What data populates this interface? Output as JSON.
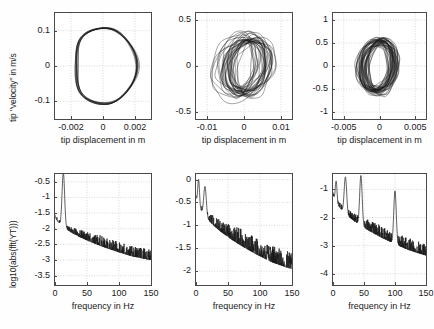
{
  "figure": {
    "background": "#fefefe",
    "axis_color": "#4a4a4a",
    "grid_color": "#c8c8c8",
    "curve_color": "#1a1a1a",
    "rows": 2,
    "cols": 3
  },
  "chart_data": [
    {
      "id": "phase-portrait-1",
      "type": "line",
      "title": "",
      "xlabel": "tip displacement in m",
      "ylabel": "tip \"velocity\" in m/s",
      "xlim": [
        -0.003,
        0.003
      ],
      "ylim": [
        -0.15,
        0.15
      ],
      "xticks": [
        -0.002,
        0,
        0.002
      ],
      "xticklabels": [
        "-0.002",
        "0",
        "0.002"
      ],
      "yticks": [
        -0.1,
        0,
        0.1
      ],
      "yticklabels": [
        "-0.1",
        "0",
        "0.1"
      ],
      "grid": true,
      "description": "Closed quasi-periodic limit cycle, single thick band orbit",
      "orbit": {
        "center_x": 0.0001,
        "center_y": 0.0,
        "radius_x": 0.0019,
        "radius_y": 0.112,
        "loops": 9,
        "jitter": 0.05,
        "shape": "rounded-hexagon"
      }
    },
    {
      "id": "phase-portrait-2",
      "type": "line",
      "title": "",
      "xlabel": "tip displacement in m",
      "ylabel": "",
      "xlim": [
        -0.013,
        0.013
      ],
      "ylim": [
        -0.58,
        0.58
      ],
      "xticks": [
        -0.01,
        0,
        0.01
      ],
      "xticklabels": [
        "-0.01",
        "0",
        "0.01"
      ],
      "yticks": [
        -0.5,
        0,
        0.5
      ],
      "yticklabels": [
        "-0.5",
        "0",
        "0.5"
      ],
      "grid": true,
      "description": "Chaotic attractor, many overlapping tilted loops skewed to the right",
      "orbit": {
        "center_x": 0.0,
        "center_y": 0.0,
        "radius_x": 0.0055,
        "radius_y": 0.3,
        "loops": 34,
        "jitter": 0.55,
        "shape": "chaotic-tilted"
      }
    },
    {
      "id": "phase-portrait-3",
      "type": "line",
      "title": "",
      "xlabel": "tip displacement in m",
      "ylabel": "",
      "xlim": [
        -0.0065,
        0.0065
      ],
      "ylim": [
        -1.15,
        1.15
      ],
      "xticks": [
        -0.005,
        0,
        0.005
      ],
      "xticklabels": [
        "-0.005",
        "0",
        "0.005"
      ],
      "yticks": [
        -1,
        -0.5,
        0,
        0.5,
        1
      ],
      "yticklabels": [
        "-1",
        "-0.5",
        "0",
        "0.5",
        "1"
      ],
      "grid": true,
      "description": "Dense chaotic attractor, tightly wound nested loops centered near origin",
      "orbit": {
        "center_x": -0.0002,
        "center_y": 0.0,
        "radius_x": 0.0022,
        "radius_y": 0.55,
        "loops": 40,
        "jitter": 0.4,
        "shape": "dense-oval"
      }
    },
    {
      "id": "spectrum-1",
      "type": "line",
      "title": "",
      "xlabel": "frequency in Hz",
      "ylabel": "log10(abs(fft(YT)))",
      "xlim": [
        0,
        150
      ],
      "ylim": [
        -3.8,
        -0.25
      ],
      "xticks": [
        0,
        50,
        100,
        150
      ],
      "xticklabels": [
        "0",
        "50",
        "100",
        "150"
      ],
      "yticks": [
        -3.5,
        -3,
        -2.5,
        -2,
        -1.5,
        -1,
        -0.5
      ],
      "yticklabels": [
        "-3.5",
        "-3",
        "-2.5",
        "-2",
        "-1.5",
        "-1",
        "-0.5"
      ],
      "grid": true,
      "description": "Single dominant narrow peak near 13 Hz clipping above axis top, then monotonic decay into noise floor near -3",
      "peaks": [
        {
          "freq": 13,
          "level": -0.2
        }
      ],
      "baseline_start": -1.55,
      "noise_floor": -3.05,
      "noise_amp": 0.28
    },
    {
      "id": "spectrum-2",
      "type": "line",
      "title": "",
      "xlabel": "frequency in Hz",
      "ylabel": "",
      "xlim": [
        0,
        150
      ],
      "ylim": [
        -2.3,
        0.12
      ],
      "xticks": [
        0,
        50,
        100,
        150
      ],
      "xticklabels": [
        "0",
        "50",
        "100",
        "150"
      ],
      "yticks": [
        -2,
        -1.5,
        -1,
        -0.5,
        0
      ],
      "yticklabels": [
        "-2",
        "-1.5",
        "-1",
        "-0.5",
        "0"
      ],
      "grid": true,
      "description": "Broadband chaotic spectrum, strongest below 25 Hz near 0, gradual roll-off to about -2.1 at 150 Hz",
      "peaks": [
        {
          "freq": 4,
          "level": 0.0
        },
        {
          "freq": 14,
          "level": -0.15
        }
      ],
      "baseline_start": -0.35,
      "noise_floor": -2.0,
      "noise_amp": 0.3
    },
    {
      "id": "spectrum-3",
      "type": "line",
      "title": "",
      "xlabel": "frequency in Hz",
      "ylabel": "",
      "xlim": [
        0,
        150
      ],
      "ylim": [
        -4.4,
        -0.45
      ],
      "xticks": [
        0,
        50,
        100,
        150
      ],
      "xticklabels": [
        "0",
        "50",
        "100",
        "150"
      ],
      "yticks": [
        -4,
        -3,
        -2,
        -1
      ],
      "yticklabels": [
        "-4",
        "-3",
        "-2",
        "-1"
      ],
      "grid": true,
      "description": "Broadband spectrum with sharp discrete peaks near 5, 20, 45 and 100 Hz above a decaying noise background",
      "peaks": [
        {
          "freq": 5,
          "level": -0.7
        },
        {
          "freq": 20,
          "level": -0.55
        },
        {
          "freq": 45,
          "level": -0.5
        },
        {
          "freq": 100,
          "level": -1.05
        }
      ],
      "baseline_start": -1.1,
      "noise_floor": -3.4,
      "noise_amp": 0.35
    }
  ]
}
